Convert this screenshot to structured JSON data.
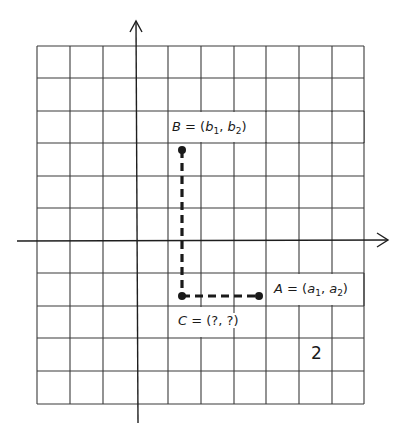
{
  "figure": {
    "number": "2",
    "colors": {
      "line": "#2a2a2a",
      "grid": "#3a3a3a",
      "background": "#ffffff"
    }
  },
  "grid": {
    "columns": 10,
    "rows": 11
  },
  "axes": {
    "x_arrow": "right-arrow",
    "y_arrow": "up-arrow"
  },
  "points": {
    "B": {
      "name": "B",
      "eq": "=",
      "open": "(",
      "v1": "b",
      "s1": "1",
      "sep": ",",
      "v2": "b",
      "s2": "2",
      "close": ")"
    },
    "A": {
      "name": "A",
      "eq": "=",
      "open": "(",
      "v1": "a",
      "s1": "1",
      "sep": ",",
      "v2": "a",
      "s2": "2",
      "close": ")"
    },
    "C": {
      "name": "C",
      "eq": "=",
      "text": "(?, ?)"
    }
  }
}
